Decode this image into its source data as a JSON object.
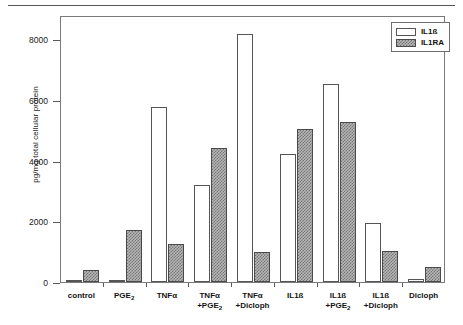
{
  "chart_data": {
    "type": "bar",
    "title": "",
    "xlabel": "",
    "ylabel": "pg/mg total cellular protein",
    "ylim": [
      0,
      8800
    ],
    "yticks": [
      0,
      2000,
      4000,
      6000,
      8000
    ],
    "ytick_labels": [
      "0",
      "2000",
      "4000",
      "6000",
      "8000"
    ],
    "grid": false,
    "legend_position": "top-right",
    "categories": [
      "control",
      "PGE2",
      "TNFa",
      "TNFa +PGE2",
      "TNFa +Dicloph",
      "IL1ß",
      "IL1ß +PGE2",
      "IL1ß +Dicloph",
      "Dicloph"
    ],
    "category_labels": [
      {
        "line1": "control",
        "line2": ""
      },
      {
        "line1": "PGE",
        "sub1": "2",
        "line2": ""
      },
      {
        "line1": "TNFα",
        "line2": ""
      },
      {
        "line1": "TNFα",
        "line2": "+PGE",
        "sub2": "2"
      },
      {
        "line1": "TNFα",
        "line2": "+Dicloph"
      },
      {
        "line1": "IL1ß",
        "line2": ""
      },
      {
        "line1": "IL1ß",
        "line2": "+PGE",
        "sub2": "2"
      },
      {
        "line1": "IL1ß",
        "line2": "+Dicloph"
      },
      {
        "line1": "Dicloph",
        "line2": ""
      }
    ],
    "series": [
      {
        "name": "IL1ß",
        "style": "open",
        "values": [
          60,
          70,
          5760,
          3195,
          8170,
          4235,
          6520,
          1950,
          105
        ]
      },
      {
        "name": "IL1RA",
        "style": "hatched",
        "values": [
          390,
          1720,
          1260,
          4410,
          1000,
          5040,
          5290,
          1010,
          480
        ]
      }
    ]
  },
  "legend": {
    "entries": [
      {
        "label": "IL1ß",
        "style": "open"
      },
      {
        "label": "IL1RA",
        "style": "hatched"
      }
    ]
  },
  "colors": {
    "axis": "#5a5a5a",
    "frame": "#7a7a7a",
    "open_fill": "#ffffff",
    "open_edge": "#555555",
    "hatch_fill": "#b5b5b5",
    "hatch_line": "#787878",
    "text": "#1a1a1a"
  }
}
